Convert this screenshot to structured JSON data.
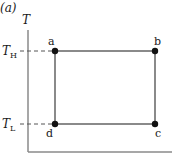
{
  "panel_label": "(a)",
  "axes": {
    "y_label": "T",
    "x_label": ""
  },
  "levels": {
    "high": {
      "symbol": "T",
      "subscript": "H"
    },
    "low": {
      "symbol": "T",
      "subscript": "L"
    }
  },
  "points": [
    {
      "id": "a",
      "label": "a",
      "level": "high",
      "position": "left"
    },
    {
      "id": "b",
      "label": "b",
      "level": "high",
      "position": "right"
    },
    {
      "id": "c",
      "label": "c",
      "level": "low",
      "position": "right"
    },
    {
      "id": "d",
      "label": "d",
      "level": "low",
      "position": "left"
    }
  ],
  "colors": {
    "cycle_line": "#8a8a8a",
    "axis_line": "#8a8a8a",
    "point": "#111111",
    "dashed": "#555555"
  }
}
